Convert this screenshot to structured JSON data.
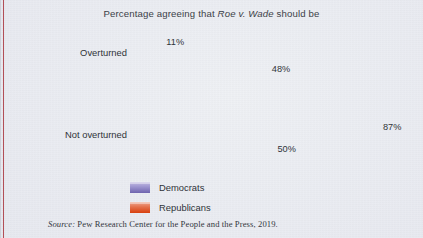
{
  "figure": {
    "title_prefix": "Percentage agreeing that ",
    "title_italic": "Roe v. Wade",
    "title_suffix": " should be",
    "source_label": "Source:",
    "source_text": " Pew Research Center for the People and the Press, 2019."
  },
  "colors": {
    "background": "#e9ebf1",
    "democrats": "#6f64ae",
    "republicans": "#dc4418",
    "page_rule": "#a8343c",
    "text": "#2f3339"
  },
  "legend": {
    "position": "below-plot-left",
    "items": [
      {
        "label": "Democrats",
        "key": "dem"
      },
      {
        "label": "Republicans",
        "key": "rep"
      }
    ]
  },
  "chart_data": {
    "type": "bar",
    "orientation": "horizontal",
    "title": "Percentage agreeing that Roe v. Wade should be",
    "xlabel": "",
    "ylabel": "",
    "xlim": [
      0,
      100
    ],
    "grid": false,
    "legend_position": "below-plot-left",
    "categories": [
      "Overturned",
      "Not overturned"
    ],
    "series": [
      {
        "name": "Democrats",
        "values": [
          11,
          87
        ],
        "value_labels": [
          "11%",
          "87%"
        ],
        "color": "#6f64ae"
      },
      {
        "name": "Republicans",
        "values": [
          48,
          50
        ],
        "value_labels": [
          "48%",
          "50%"
        ],
        "color": "#dc4418"
      }
    ],
    "units": "percent",
    "source": "Pew Research Center for the People and the Press, 2019."
  }
}
